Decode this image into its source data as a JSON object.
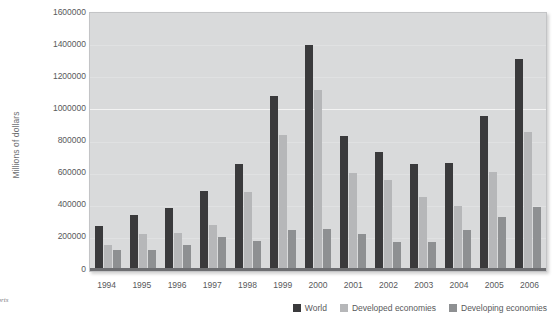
{
  "chart_data": {
    "type": "bar",
    "title": "",
    "subtitle": "",
    "xlabel": "",
    "ylabel": "Millions of dollars",
    "ylim": [
      0,
      1600000
    ],
    "ytick_values": [
      0,
      200000,
      400000,
      600000,
      800000,
      1000000,
      1200000,
      1400000,
      1600000
    ],
    "ytick_labels": [
      "0",
      "200000",
      "400000",
      "600000",
      "800000",
      "1000000",
      "1200000",
      "1400000",
      "1600000"
    ],
    "grid": true,
    "grid_axis": "y",
    "legend_position": "bottom-right",
    "categories": [
      "1994",
      "1995",
      "1996",
      "1997",
      "1998",
      "1999",
      "2000",
      "2001",
      "2002",
      "2003",
      "2004",
      "2005",
      "2006"
    ],
    "series": [
      {
        "name": "World",
        "color": "#3a3a3c",
        "values": [
          260000,
          330000,
          375000,
          480000,
          645000,
          1070000,
          1390000,
          820000,
          725000,
          645000,
          655000,
          945000,
          1300000
        ]
      },
      {
        "name": "Developed economies",
        "color": "#b6b7b9",
        "values": [
          145000,
          210000,
          220000,
          270000,
          475000,
          825000,
          1110000,
          590000,
          550000,
          445000,
          385000,
          595000,
          845000
        ]
      },
      {
        "name": "Developing economies",
        "color": "#8e9092",
        "values": [
          115000,
          115000,
          145000,
          195000,
          170000,
          235000,
          245000,
          210000,
          165000,
          165000,
          235000,
          320000,
          380000
        ]
      }
    ]
  },
  "source_note": {
    "line1": "eports",
    "line2": "N)"
  },
  "colors": {
    "plot_background": "#d9dadb",
    "plot_border": "#c3c4c6",
    "gridline": "#f1f1f1",
    "axis": "#6d6e71",
    "text": "#58595b"
  }
}
